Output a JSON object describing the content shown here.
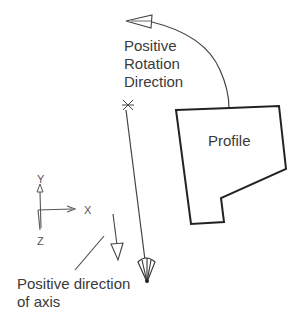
{
  "diagram": {
    "rotation_label": [
      "Positive",
      "Rotation",
      "Direction"
    ],
    "profile_label": "Profile",
    "axis_label": [
      "Positive direction",
      "of axis"
    ],
    "triad": {
      "x": "X",
      "y": "Y",
      "z": "Z"
    }
  },
  "colors": {
    "stroke": "#333333",
    "text": "#3a3a3a",
    "background": "#ffffff"
  }
}
